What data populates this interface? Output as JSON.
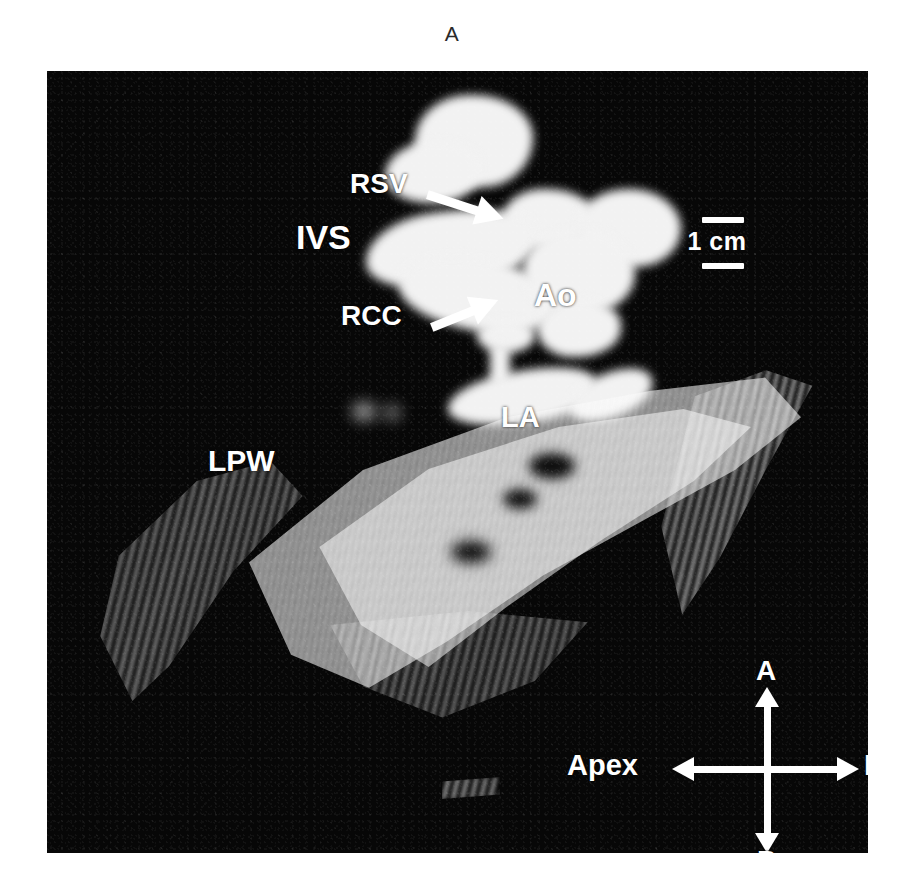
{
  "figure": {
    "panel_letter": "A",
    "modality": "two-dimensional echocardiogram",
    "background_color": "#ffffff",
    "scan_background_color": "#070707",
    "annotation_color": "#ffffff"
  },
  "scale": {
    "label": "1 cm",
    "marker": "bracket-rules"
  },
  "labels": [
    {
      "id": "rsv",
      "text": "RSV",
      "has_pointer": true,
      "pointer_direction": "right-down"
    },
    {
      "id": "ivs",
      "text": "IVS",
      "has_pointer": false,
      "pointer_direction": ""
    },
    {
      "id": "rcc",
      "text": "RCC",
      "has_pointer": true,
      "pointer_direction": "right-up"
    },
    {
      "id": "ao",
      "text": "Ao",
      "has_pointer": false,
      "pointer_direction": ""
    },
    {
      "id": "la",
      "text": "LA",
      "has_pointer": false,
      "pointer_direction": ""
    },
    {
      "id": "lpw",
      "text": "LPW",
      "has_pointer": false,
      "pointer_direction": ""
    }
  ],
  "orientation": {
    "anterior": "A",
    "posterior": "P",
    "left": "Apex",
    "right": "Base"
  }
}
